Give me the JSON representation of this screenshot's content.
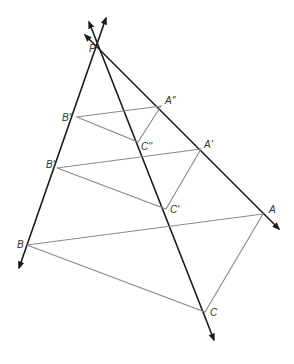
{
  "diagram": {
    "colors": {
      "lines": "#1a1a1a",
      "triangles": "#8a8a8a",
      "labels": "#333333"
    },
    "center": {
      "label": "P",
      "x": 101,
      "y": 50
    },
    "rays": [
      {
        "name": "ray-pb",
        "from": [
          106,
          18
        ],
        "to": [
          19,
          268
        ]
      },
      {
        "name": "ray-pc",
        "from": [
          89,
          22
        ],
        "to": [
          214,
          340
        ]
      },
      {
        "name": "ray-pa",
        "from": [
          85,
          35
        ],
        "to": [
          279,
          229
        ]
      }
    ],
    "triangles": [
      {
        "name": "triangle-double-prime",
        "points": {
          "A": [
            161,
            106
          ],
          "B": [
            77,
            117
          ],
          "C": [
            138,
            142
          ]
        },
        "labels": {
          "A": "A''",
          "B": "B''",
          "C": "C''"
        }
      },
      {
        "name": "triangle-prime",
        "points": {
          "A": [
            201,
            149
          ],
          "B": [
            57,
            168
          ],
          "C": [
            166,
            209
          ]
        },
        "labels": {
          "A": "A'",
          "B": "B'",
          "C": "C'"
        }
      },
      {
        "name": "triangle-original",
        "points": {
          "A": [
            263,
            214
          ],
          "B": [
            27,
            245
          ],
          "C": [
            205,
            312
          ]
        },
        "labels": {
          "A": "A",
          "B": "B",
          "C": "C"
        }
      }
    ]
  }
}
